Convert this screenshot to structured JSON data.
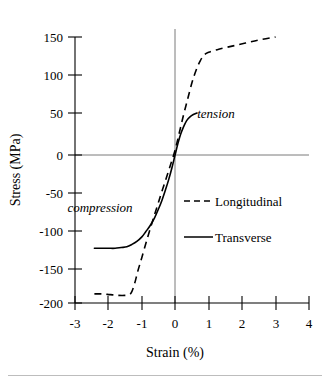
{
  "chart_data": {
    "type": "line",
    "title": "",
    "xlabel": "Strain (%)",
    "ylabel": "Stress (MPa)",
    "xlim": [
      -3,
      4
    ],
    "ylim": [
      -200,
      150
    ],
    "xticks": [
      "-3",
      "-2",
      "-1",
      "0",
      "1",
      "2",
      "3",
      "4"
    ],
    "xtick_values": [
      -3,
      -2,
      -1,
      0,
      1,
      2,
      3,
      4
    ],
    "yticks": [
      "150",
      "100",
      "50",
      "0",
      "-50",
      "-100",
      "-150",
      "-200"
    ],
    "ytick_values": [
      150,
      100,
      50,
      0,
      -50,
      -100,
      -150,
      -200
    ],
    "grid": false,
    "legend_position": "center-right",
    "series": [
      {
        "name": "Longitudinal",
        "style": "dashed",
        "color": "#000000",
        "points": [
          [
            -2.42,
            -188
          ],
          [
            -2.2,
            -188
          ],
          [
            -1.95,
            -189
          ],
          [
            -1.7,
            -190
          ],
          [
            -1.5,
            -190
          ],
          [
            -1.37,
            -189
          ],
          [
            -1.3,
            -185
          ],
          [
            -1.22,
            -175
          ],
          [
            -1.12,
            -158
          ],
          [
            -1.0,
            -140
          ],
          [
            -0.85,
            -117
          ],
          [
            -0.7,
            -95
          ],
          [
            -0.55,
            -74
          ],
          [
            -0.4,
            -53
          ],
          [
            -0.25,
            -33
          ],
          [
            -0.12,
            -15
          ],
          [
            0.0,
            2
          ],
          [
            0.12,
            24
          ],
          [
            0.25,
            48
          ],
          [
            0.38,
            70
          ],
          [
            0.5,
            90
          ],
          [
            0.62,
            106
          ],
          [
            0.75,
            119
          ],
          [
            0.88,
            127
          ],
          [
            1.0,
            130
          ],
          [
            1.3,
            134
          ],
          [
            1.7,
            138
          ],
          [
            2.1,
            142
          ],
          [
            2.5,
            146
          ],
          [
            3.0,
            150
          ]
        ]
      },
      {
        "name": "Transverse",
        "style": "solid",
        "color": "#000000",
        "points": [
          [
            -2.42,
            -128
          ],
          [
            -2.2,
            -128
          ],
          [
            -2.0,
            -128
          ],
          [
            -1.8,
            -128
          ],
          [
            -1.62,
            -127
          ],
          [
            -1.45,
            -126
          ],
          [
            -1.3,
            -123
          ],
          [
            -1.15,
            -119
          ],
          [
            -1.0,
            -113
          ],
          [
            -0.88,
            -106
          ],
          [
            -0.75,
            -98
          ],
          [
            -0.62,
            -88
          ],
          [
            -0.5,
            -76
          ],
          [
            -0.4,
            -65
          ],
          [
            -0.3,
            -52
          ],
          [
            -0.2,
            -38
          ],
          [
            -0.1,
            -22
          ],
          [
            0.0,
            -4
          ],
          [
            0.08,
            10
          ],
          [
            0.16,
            22
          ],
          [
            0.25,
            32
          ],
          [
            0.34,
            40
          ],
          [
            0.44,
            45
          ],
          [
            0.54,
            48
          ],
          [
            0.65,
            50
          ]
        ]
      }
    ],
    "annotations": [
      {
        "text": "tension",
        "x": 1.7,
        "y": 60,
        "style": "italic"
      },
      {
        "text": "compression",
        "x": -2.25,
        "y": -68,
        "style": "italic"
      }
    ],
    "legend_entries": [
      {
        "label": "Longitudinal",
        "style": "dashed"
      },
      {
        "label": "Transverse",
        "style": "solid"
      }
    ]
  }
}
